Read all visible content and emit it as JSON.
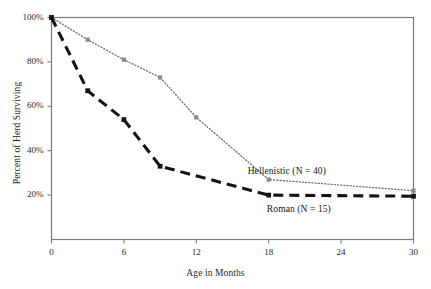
{
  "chart_data": {
    "type": "line",
    "title": "",
    "xlabel": "Age in Months",
    "ylabel": "Percent of Herd Surviving",
    "xlim": [
      0,
      30
    ],
    "ylim": [
      0,
      100
    ],
    "xticks": [
      0,
      6,
      12,
      18,
      24,
      30
    ],
    "xtick_labels": [
      "0",
      "6",
      "12",
      "18",
      "24",
      "30"
    ],
    "yticks": [
      20,
      40,
      60,
      80,
      100
    ],
    "ytick_labels": [
      "20%",
      "40%",
      "60%",
      "80%",
      "100%"
    ],
    "grid": false,
    "legend_position": "inline-annotation",
    "series": [
      {
        "name": "Hellenistic (N = 40)",
        "label": "Hellenistic (N = 40)",
        "style": "dotted",
        "color": "#6e6e6e",
        "marker": "square",
        "marker_color": "#8a8a8a",
        "x": [
          0,
          3,
          6,
          9,
          12,
          18,
          30
        ],
        "values": [
          100,
          90,
          81,
          73,
          55,
          27,
          22
        ]
      },
      {
        "name": "Roman (N = 15)",
        "label": "Roman (N = 15)",
        "style": "dashed",
        "color": "#141414",
        "marker": "square",
        "marker_color": "#141414",
        "x": [
          0,
          3,
          6,
          9,
          18,
          30
        ],
        "values": [
          100,
          67,
          54,
          33,
          20,
          19.5
        ]
      }
    ],
    "annotations": [
      {
        "text": "Hellenistic (N = 40)",
        "x": 19.5,
        "y": 30
      },
      {
        "text": "Roman (N = 15)",
        "x": 20.5,
        "y": 13
      }
    ]
  },
  "colors": {
    "axis": "#7a7a7a",
    "hellenistic": "#6e6e6e",
    "roman": "#141414",
    "text": "#1f1f1f",
    "background": "#ffffff"
  }
}
